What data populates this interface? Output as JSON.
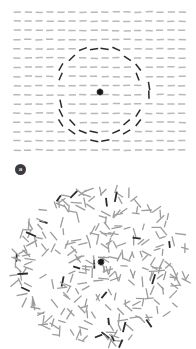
{
  "figure": {
    "background_color": "#ffffff",
    "width": 196,
    "height": 349
  },
  "panels": [
    {
      "id": "a",
      "badge_label": "a",
      "badge_bg_color": "#3b3b3b",
      "badge_text_color": "#e8e8e8",
      "description": "Regular grid of horizontal line elements with an embedded circular contour of tilted darker elements"
    },
    {
      "id": "b",
      "badge_label": "b",
      "badge_bg_color": "#3b3b3b",
      "badge_text_color": "#e8e8e8",
      "description": "Random cloud of line elements with random orientations"
    }
  ],
  "chart_data": [
    {
      "type": "scatter",
      "panel": "a",
      "title": "",
      "xlabel": "",
      "ylabel": "",
      "grid": true,
      "legend": false,
      "xlim": [
        0,
        196
      ],
      "ylim": [
        0,
        180
      ],
      "element_length": 7.2,
      "element_thickness": 1.5,
      "base_color": "#b9b9b9",
      "target_color": "#2b2b2b",
      "grid_origin_x": 17,
      "grid_origin_y": 12,
      "grid_spacing_x": 11.0,
      "grid_spacing_y": 9.2,
      "grid_cols": 16,
      "grid_rows": 16,
      "base_orientation_deg": 0,
      "contour": {
        "shape": "circle",
        "center_x": 100,
        "center_y": 92,
        "radius": 45,
        "tangential": true,
        "n_elements": 16
      },
      "center_blob": {
        "x": 100,
        "y": 92,
        "radius": 2.6,
        "color": "#1a1a1a"
      }
    },
    {
      "type": "scatter",
      "panel": "b",
      "title": "",
      "xlabel": "",
      "ylabel": "",
      "grid": false,
      "legend": false,
      "xlim": [
        0,
        196
      ],
      "ylim": [
        0,
        169
      ],
      "element_length": 9.0,
      "element_thickness": 1.3,
      "base_color": "#9c9c9c",
      "target_color": "#2b2b2b",
      "cloud_center_x": 100,
      "cloud_center_y": 85,
      "cloud_radius": 88,
      "n_elements": 300,
      "orientation_distribution": "uniform-random",
      "dark_fraction": 0.07,
      "center_blob": {
        "x": 101,
        "y": 82,
        "radius": 2.4,
        "color": "#1a1a1a"
      }
    }
  ]
}
